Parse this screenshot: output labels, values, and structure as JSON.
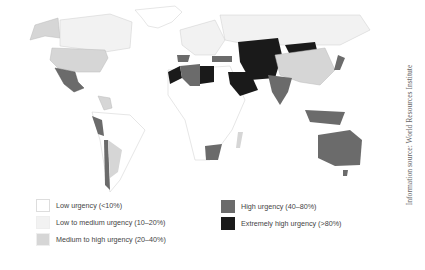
{
  "legend": {
    "items": [
      {
        "label": "Low urgency (<10%)",
        "color": "#ffffff"
      },
      {
        "label": "Low to medium urgency (10–20%)",
        "color": "#f2f2f2"
      },
      {
        "label": "Medium to high urgency (20–40%)",
        "color": "#d6d6d6"
      },
      {
        "label": "High urgency (40–80%)",
        "color": "#6b6b6b"
      },
      {
        "label": "Extremely high urgency (>80%)",
        "color": "#1a1a1a"
      }
    ]
  },
  "source": "Information source: World Resources Institute",
  "regions": {
    "low": [
      "Greenland",
      "Central Africa",
      "Brazil",
      "Scandinavia"
    ],
    "low_medium": [
      "Canada",
      "Russia",
      "Brazil south",
      "Eastern Europe"
    ],
    "medium_high": [
      "USA",
      "Alaska",
      "Argentina",
      "China",
      "Ukraine",
      "Madagascar",
      "Central America"
    ],
    "high": [
      "Mexico",
      "Peru",
      "Chile",
      "Spain",
      "Algeria",
      "South Africa",
      "India",
      "Australia",
      "Japan",
      "Indonesia",
      "Turkey",
      "Philippines"
    ],
    "extremely_high": [
      "Morocco",
      "Libya",
      "Saudi Arabia",
      "Iran",
      "Afghanistan",
      "Pakistan",
      "Kazakhstan",
      "Uzbekistan",
      "Mongolia",
      "Yemen"
    ]
  }
}
